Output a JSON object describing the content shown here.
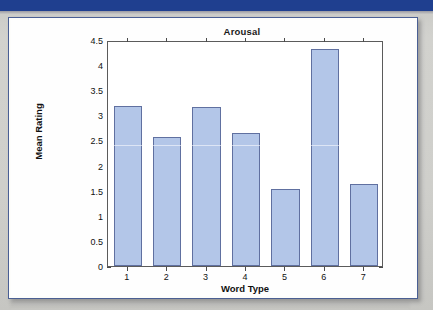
{
  "page": {
    "header_band_color": "#1f3f8f",
    "background_color": "#cfcfcb",
    "card_border_color": "#4a5f94"
  },
  "chart_data": {
    "type": "bar",
    "title": "Arousal",
    "xlabel": "Word Type",
    "ylabel": "Mean Rating",
    "categories": [
      "1",
      "2",
      "3",
      "4",
      "5",
      "6",
      "7"
    ],
    "values": [
      3.19,
      2.57,
      3.16,
      2.65,
      1.54,
      4.32,
      1.63
    ],
    "ylim": [
      0,
      4.5
    ],
    "yticks": [
      "0",
      "0.5",
      "1",
      "1.5",
      "2",
      "2.5",
      "3",
      "3.5",
      "4",
      "4.5"
    ],
    "ytick_values": [
      0,
      0.5,
      1,
      1.5,
      2,
      2.5,
      3,
      3.5,
      4,
      4.5
    ],
    "grid": false,
    "legend": null,
    "bar_fill_color": "#b3c6e8",
    "bar_edge_color": "#6070a0",
    "axes_color": "#5b5b5b",
    "annotation": "horizontal scan streak artifact near 2.45"
  }
}
